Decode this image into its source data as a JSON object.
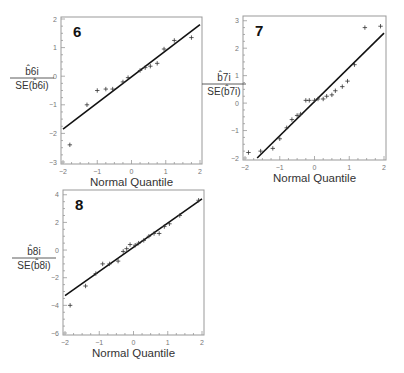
{
  "chart_data": [
    {
      "type": "scatter",
      "title": "6",
      "xlabel": "Normal Quantile",
      "ylabel": {
        "numerator": "b̂6i",
        "denominator": "SE(b̂6i)"
      },
      "xlim": [
        -2,
        2
      ],
      "ylim": [
        -3,
        2
      ],
      "xticks": [
        -2,
        -1,
        0,
        1,
        2
      ],
      "yticks": [
        -3,
        -2,
        -1,
        0,
        1,
        2
      ],
      "grid": false,
      "points": [
        [
          -1.8,
          -2.4
        ],
        [
          -1.3,
          -1.0
        ],
        [
          -1.0,
          -0.5
        ],
        [
          -0.75,
          -0.45
        ],
        [
          -0.55,
          -0.45
        ],
        [
          -0.25,
          -0.2
        ],
        [
          -0.1,
          -0.05
        ],
        [
          0.25,
          0.2
        ],
        [
          0.4,
          0.3
        ],
        [
          0.55,
          0.35
        ],
        [
          0.75,
          0.45
        ],
        [
          0.95,
          0.95
        ],
        [
          1.25,
          1.25
        ],
        [
          1.75,
          1.35
        ]
      ],
      "reference_line": [
        [
          -2,
          -1.85
        ],
        [
          2,
          1.8
        ]
      ]
    },
    {
      "type": "scatter",
      "title": "7",
      "xlabel": "Normal Quantile",
      "ylabel": {
        "numerator": "b̂7i",
        "denominator": "SE(b̂7i)"
      },
      "xlim": [
        -2,
        2
      ],
      "ylim": [
        -2,
        3.1
      ],
      "xticks": [
        -2,
        -1,
        0,
        1,
        2
      ],
      "yticks": [
        -2,
        -1,
        0,
        1,
        2,
        3
      ],
      "grid": false,
      "points": [
        [
          -1.9,
          -1.8
        ],
        [
          -1.55,
          -1.75
        ],
        [
          -1.2,
          -1.65
        ],
        [
          -1.0,
          -1.3
        ],
        [
          -0.8,
          -0.9
        ],
        [
          -0.65,
          -0.6
        ],
        [
          -0.5,
          -0.45
        ],
        [
          -0.4,
          -0.4
        ],
        [
          -0.25,
          0.1
        ],
        [
          -0.15,
          0.1
        ],
        [
          0.0,
          0.1
        ],
        [
          0.1,
          0.15
        ],
        [
          0.25,
          0.15
        ],
        [
          0.35,
          0.25
        ],
        [
          0.5,
          0.3
        ],
        [
          0.6,
          0.45
        ],
        [
          0.8,
          0.6
        ],
        [
          0.95,
          0.8
        ],
        [
          1.15,
          1.4
        ],
        [
          1.45,
          2.75
        ],
        [
          1.9,
          2.8
        ]
      ],
      "reference_line": [
        [
          -1.65,
          -2
        ],
        [
          2,
          2.55
        ]
      ]
    },
    {
      "type": "scatter",
      "title": "8",
      "xlabel": "Normal Quantile",
      "ylabel": {
        "numerator": "b̂8i",
        "denominator": "SE(b̂8i)"
      },
      "xlim": [
        -2,
        2
      ],
      "ylim": [
        -6,
        4.2
      ],
      "xticks": [
        -2,
        -1,
        0,
        1,
        2
      ],
      "yticks": [
        -6,
        -4,
        -2,
        0,
        2,
        4
      ],
      "grid": false,
      "points": [
        [
          -1.85,
          -4.0
        ],
        [
          -1.4,
          -2.6
        ],
        [
          -1.1,
          -1.7
        ],
        [
          -0.9,
          -1.0
        ],
        [
          -0.7,
          -1.0
        ],
        [
          -0.45,
          -0.8
        ],
        [
          -0.3,
          -0.1
        ],
        [
          -0.2,
          0.1
        ],
        [
          -0.1,
          0.4
        ],
        [
          0.05,
          0.35
        ],
        [
          0.15,
          0.5
        ],
        [
          0.3,
          0.7
        ],
        [
          0.45,
          1.0
        ],
        [
          0.6,
          1.2
        ],
        [
          0.75,
          1.2
        ],
        [
          0.9,
          1.7
        ],
        [
          1.05,
          1.9
        ],
        [
          1.35,
          2.5
        ],
        [
          1.9,
          3.6
        ]
      ],
      "reference_line": [
        [
          -2,
          -3.3
        ],
        [
          2,
          3.7
        ]
      ]
    }
  ],
  "layout": {
    "panels": [
      {
        "frame": [
          61,
          17,
          202,
          164
        ],
        "label_pos": [
          10,
          78
        ]
      },
      {
        "frame": [
          243,
          16,
          386,
          160
        ],
        "label_pos": [
          202,
          84
        ]
      },
      {
        "frame": [
          63,
          190,
          204,
          335
        ],
        "label_pos": [
          12,
          258
        ]
      }
    ]
  },
  "colors": {
    "axis": "#999999",
    "line": "#111111",
    "marker": "#333333"
  }
}
